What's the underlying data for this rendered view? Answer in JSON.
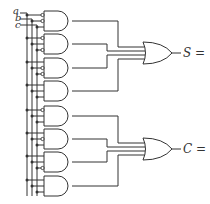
{
  "diagram": {
    "type": "logic-circuit",
    "inputs": [
      {
        "label": "a",
        "y": 13
      },
      {
        "label": "b",
        "y": 19
      },
      {
        "label": "c",
        "y": 25
      }
    ],
    "and_gates": [
      {
        "top": 11,
        "bubbles": [
          1,
          1,
          0
        ]
      },
      {
        "top": 34,
        "bubbles": [
          1,
          0,
          1
        ]
      },
      {
        "top": 58,
        "bubbles": [
          0,
          1,
          1
        ]
      },
      {
        "top": 81,
        "bubbles": [
          0,
          0,
          0
        ]
      },
      {
        "top": 106,
        "bubbles": [
          1,
          0,
          0
        ]
      },
      {
        "top": 129,
        "bubbles": [
          0,
          1,
          0
        ]
      },
      {
        "top": 152,
        "bubbles": [
          0,
          0,
          1
        ]
      },
      {
        "top": 176,
        "bubbles": [
          0,
          0,
          0
        ]
      }
    ],
    "outputs": [
      {
        "label": "S =",
        "y": 53
      },
      {
        "label": "C =",
        "y": 149
      }
    ],
    "colors": {
      "line": "#333333",
      "background": "#ffffff"
    }
  }
}
